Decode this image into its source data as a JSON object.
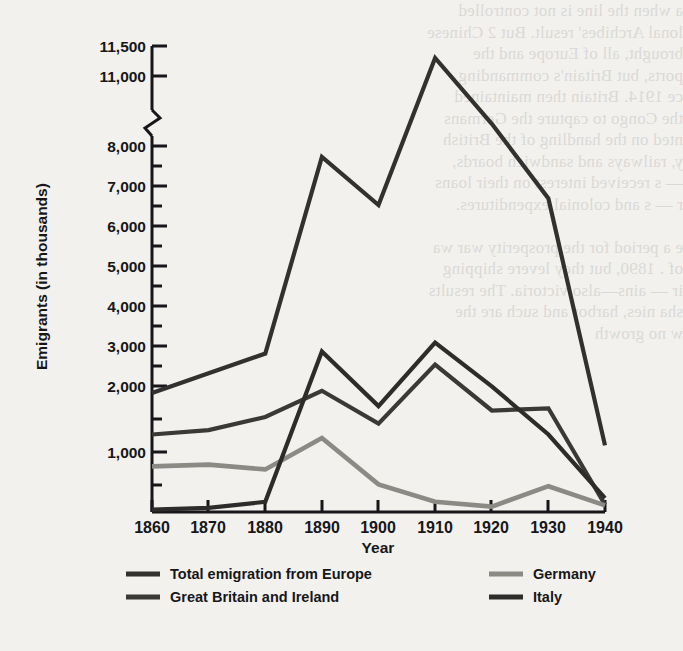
{
  "chart_data": {
    "type": "line",
    "title": "",
    "xlabel": "Year",
    "ylabel": "Emigrants (in thousands)",
    "x": [
      1860,
      1870,
      1880,
      1890,
      1900,
      1910,
      1920,
      1930,
      1940
    ],
    "xtick_labels": [
      "1860",
      "1870",
      "1880",
      "1890",
      "1900",
      "1910",
      "1920",
      "1930",
      "1940"
    ],
    "ytick_labels": [
      "11,500",
      "11,000",
      "8,000",
      "7,000",
      "6,000",
      "5,000",
      "4,000",
      "3,000",
      "2,000",
      "1,000"
    ],
    "ytick_values": [
      11500,
      11000,
      8000,
      7000,
      6000,
      5000,
      4000,
      3000,
      2000,
      1000
    ],
    "ylim": [
      0,
      11500
    ],
    "axis_break": {
      "present": true,
      "between": [
        8000,
        11000
      ],
      "symbol": "zigzag"
    },
    "grid": false,
    "legend_position": "bottom",
    "minor_ticks_every": 500,
    "series": [
      {
        "name": "Total emigration from Europe",
        "color": "#33312f",
        "width": 4.2,
        "values": [
          2350,
          2800,
          3250,
          7750,
          6650,
          11300,
          8950,
          6800,
          1150
        ]
      },
      {
        "name": "Great Britain and Ireland",
        "color": "#3b3936",
        "width": 4.2,
        "values": [
          1400,
          1500,
          1800,
          2400,
          1650,
          3000,
          1950,
          2000,
          120
        ]
      },
      {
        "name": "Germany",
        "color": "#8c8a85",
        "width": 4.6,
        "values": [
          760,
          790,
          710,
          1320,
          460,
          170,
          90,
          430,
          110
        ]
      },
      {
        "name": "Italy",
        "color": "#2e2c2a",
        "width": 4.2,
        "values": [
          40,
          70,
          170,
          3300,
          2050,
          3500,
          2500,
          1400,
          230
        ]
      }
    ]
  },
  "legend": {
    "entries": [
      {
        "label": "Total emigration from Europe",
        "color": "#33312f"
      },
      {
        "label": "Great Britain and Ireland",
        "color": "#3b3936"
      },
      {
        "label": "Germany",
        "color": "#8c8a85"
      },
      {
        "label": "Italy",
        "color": "#2e2c2a"
      }
    ]
  },
  "bleed_through_text": "a  when the line is not controlled\nlonal Archibes' result. But 2 Chinese\nbrought, all of Europe and the\nports, but Britain's commanding\nce 1914. Britain then maintained\nthe Congo to capture the Germans\nnted on the handling of the British\n y, railways and sandwich boards,\n— s received interest on their loans\nr —  s and colonial expenditures.\n\ne  a period for the prosperity war wa\nof  . 1890, but they levere shipping\nir  —  ains—also victoria. The results\nsha  nies, harbor and such are the\nw  no growth"
}
